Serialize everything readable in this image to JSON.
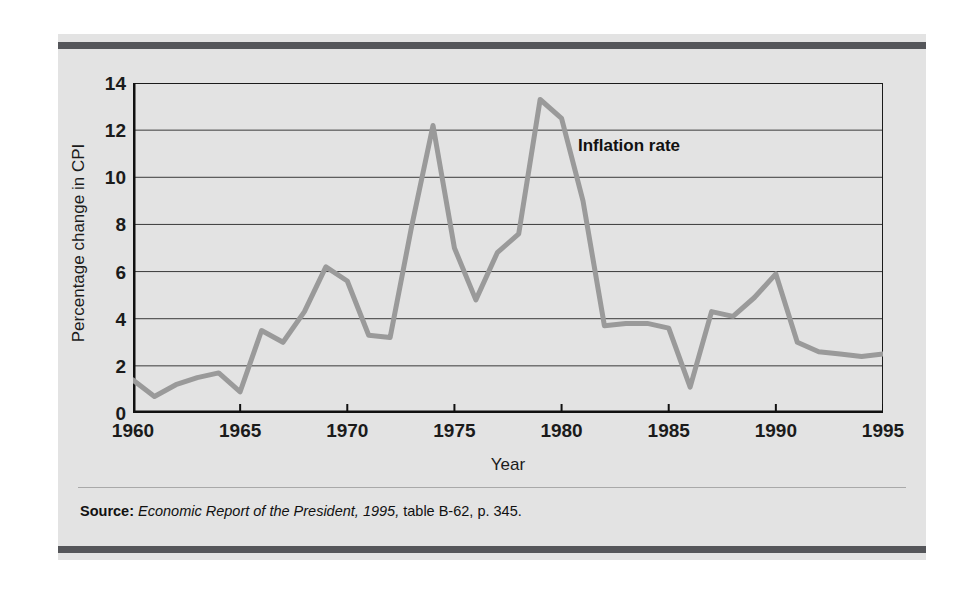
{
  "figure": {
    "panel_color": "#e3e3e3",
    "rule_color": "#55565a",
    "series_label": "Inflation rate",
    "source": {
      "label": "Source:",
      "title": "Economic Report of the President, 1995,",
      "detail": "table B-62, p. 345."
    }
  },
  "chart_data": {
    "type": "line",
    "title": "",
    "xlabel": "Year",
    "ylabel": "Percentage change in CPI",
    "xlim": [
      1960,
      1995
    ],
    "ylim": [
      0,
      14
    ],
    "xticks": [
      1960,
      1965,
      1970,
      1975,
      1980,
      1985,
      1990,
      1995
    ],
    "xtick_labels": [
      "1960",
      "1965",
      "1970",
      "1975",
      "1980",
      "1985",
      "1990",
      "1995"
    ],
    "yticks": [
      0,
      2,
      4,
      6,
      8,
      10,
      12,
      14
    ],
    "ytick_labels": [
      "0",
      "2",
      "4",
      "6",
      "8",
      "10",
      "12",
      "14"
    ],
    "grid": "horizontal",
    "legend": "none",
    "annotations": [
      {
        "text": "Inflation rate",
        "x": 1980.6,
        "y": 11.6
      }
    ],
    "series": [
      {
        "name": "Inflation rate",
        "color": "#9a9a9a",
        "line_width": 5,
        "x": [
          1960,
          1961,
          1962,
          1963,
          1964,
          1965,
          1966,
          1967,
          1968,
          1969,
          1970,
          1971,
          1972,
          1973,
          1974,
          1975,
          1976,
          1977,
          1978,
          1979,
          1980,
          1981,
          1982,
          1983,
          1984,
          1985,
          1986,
          1987,
          1988,
          1989,
          1990,
          1991,
          1992,
          1993,
          1994,
          1995
        ],
        "values": [
          1.4,
          0.7,
          1.2,
          1.5,
          1.7,
          0.9,
          3.5,
          3.0,
          4.3,
          6.2,
          5.6,
          3.3,
          3.2,
          7.9,
          12.2,
          7.0,
          4.8,
          6.8,
          7.6,
          13.3,
          12.5,
          9.0,
          3.7,
          3.8,
          3.8,
          3.6,
          1.1,
          4.3,
          4.1,
          4.9,
          5.9,
          3.0,
          2.6,
          2.5,
          2.4,
          2.5
        ]
      }
    ]
  }
}
